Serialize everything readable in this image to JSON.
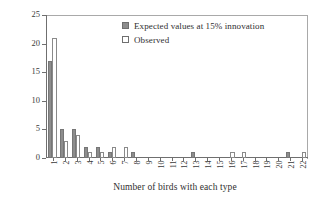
{
  "chart_data": {
    "type": "bar",
    "title": "",
    "xlabel": "Number of birds with each type",
    "ylabel": "Number of song types",
    "categories": [
      "1",
      "2",
      "3",
      "4",
      "5",
      "6",
      "7",
      "8",
      "9",
      "10",
      "11",
      "12",
      "13",
      "14",
      "15",
      "16",
      "17",
      "18",
      "19",
      "20",
      "21",
      "22"
    ],
    "ylim": [
      0,
      25
    ],
    "yticks": [
      "0",
      "5",
      "10",
      "15",
      "20",
      "25"
    ],
    "grid": false,
    "legend_position": "top-center",
    "series": [
      {
        "name": "Expected values at 15% innovation",
        "style": "filled-gray",
        "color": "#8d8d8d",
        "values": [
          17,
          5,
          5,
          2,
          2,
          1,
          0,
          1,
          0,
          0,
          0,
          0,
          1,
          0,
          0,
          0,
          0,
          0,
          0,
          0,
          1,
          0
        ]
      },
      {
        "name": "Observed",
        "style": "open-white",
        "color": "#ffffff",
        "values": [
          21,
          3,
          4,
          1,
          1,
          2,
          2,
          0,
          0,
          0,
          0,
          0,
          0,
          0,
          0,
          1,
          1,
          0,
          0,
          0,
          0,
          1
        ]
      }
    ]
  },
  "legend": {
    "items": [
      {
        "label": "Expected values at 15% innovation",
        "swatch": "filled-gray-swatch"
      },
      {
        "label": "Observed",
        "swatch": "open-white-swatch"
      }
    ]
  },
  "axes": {
    "y_title": "Number of song types",
    "x_title": "Number of birds with each type"
  }
}
